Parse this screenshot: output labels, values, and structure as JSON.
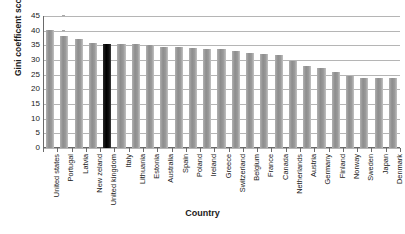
{
  "chart_data": {
    "type": "bar",
    "title": "",
    "xlabel": "Country",
    "ylabel": "Gini coefficent score",
    "ylim": [
      0,
      45
    ],
    "yticks": [
      0,
      5,
      10,
      15,
      20,
      25,
      30,
      35,
      40,
      45
    ],
    "grid": true,
    "legend": "none",
    "highlight_category": "United kingdom",
    "highlight_color": "#000000",
    "bar_color": "#999999",
    "categories": [
      "United states",
      "Portugal",
      "Latvia",
      "New zeland",
      "United kingdom",
      "Italy",
      "Lithuania",
      "Estonia",
      "Australia",
      "Spain",
      "Poland",
      "Ireland",
      "Greece",
      "Switzerland",
      "Belgium",
      "France",
      "Canada",
      "Netherlands",
      "Austria",
      "Germany",
      "Finland",
      "Norway",
      "Sweden",
      "Japan",
      "Denmark"
    ],
    "values": [
      40.2,
      38.2,
      37.3,
      35.7,
      35.6,
      35.4,
      35.3,
      35.1,
      34.6,
      34.5,
      34.2,
      33.8,
      33.7,
      33.0,
      32.3,
      32.1,
      31.8,
      29.8,
      28.0,
      27.2,
      26.0,
      24.6,
      24.0,
      24.0,
      24.0
    ]
  }
}
